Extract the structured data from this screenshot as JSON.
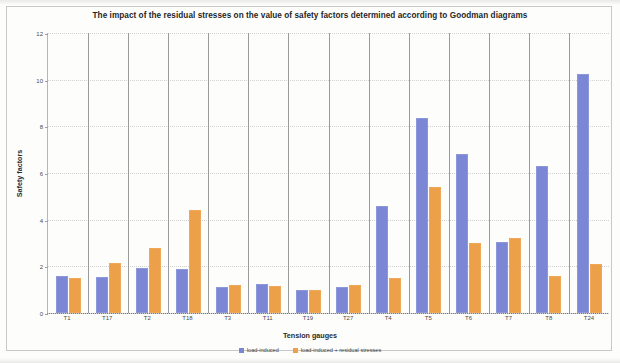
{
  "chart_data": {
    "type": "bar",
    "title": "The impact of the residual stresses on the value of safety factors determined according to Goodman diagrams",
    "xlabel": "Tension gauges",
    "ylabel": "Safety factors",
    "categories": [
      "T1",
      "T17",
      "T2",
      "T18",
      "T3",
      "T11",
      "T19",
      "T27",
      "T4",
      "T5",
      "T6",
      "T7",
      "T8",
      "T24"
    ],
    "series": [
      {
        "name": "load-induced",
        "color": "#7b87d4",
        "values": [
          1.6,
          1.55,
          1.95,
          1.9,
          1.1,
          1.25,
          1.0,
          1.1,
          4.6,
          8.35,
          6.8,
          3.05,
          6.3,
          10.25
        ]
      },
      {
        "name": "load-induced + residual stresses",
        "color": "#eda04a",
        "values": [
          1.5,
          2.15,
          2.8,
          4.4,
          1.2,
          1.15,
          1.0,
          1.2,
          1.5,
          5.4,
          3.0,
          3.2,
          1.6,
          2.1
        ]
      }
    ],
    "ylim": [
      0,
      12
    ],
    "yticks": [
      0,
      2,
      4,
      6,
      8,
      10,
      12
    ],
    "ytick_labels": [
      "0",
      "2",
      "4",
      "6",
      "8",
      "10",
      "12"
    ],
    "grid": "horizontal-dotted-and-vertical-category-separators",
    "legend_position": "bottom-center"
  }
}
